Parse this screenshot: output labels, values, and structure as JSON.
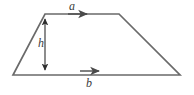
{
  "figure": {
    "kind": "geometry-diagram",
    "shape_name": "trapezoid",
    "stroke_color": "#6a6a6a",
    "label_color": "#3b3b3b",
    "background_color": "#ffffff",
    "labels": {
      "top_side": "a",
      "bottom_side": "b",
      "height": "h"
    },
    "geometry": {
      "vertices": {
        "top_left": [
          45,
          14
        ],
        "top_right": [
          119,
          14
        ],
        "bottom_right": [
          180,
          75
        ],
        "bottom_left": [
          13,
          75
        ]
      },
      "height_line": {
        "x": 45,
        "y_top": 14,
        "y_bottom": 75,
        "arrowheads": "both"
      },
      "top_arrow": {
        "x_start": 68,
        "x_end": 88,
        "y": 14,
        "direction": "right"
      },
      "bottom_arrow": {
        "x_start": 80,
        "x_end": 100,
        "y": 71,
        "direction": "right"
      }
    },
    "label_positions": {
      "a": [
        72,
        10
      ],
      "b": [
        89,
        87
      ],
      "h": [
        41,
        47
      ]
    }
  }
}
